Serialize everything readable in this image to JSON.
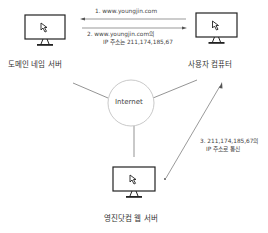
{
  "nodes": {
    "dns_server": {
      "label": "도메인 네임 서버",
      "icon": "monitor-cursor-icon"
    },
    "user_computer": {
      "label": "사용자 컴퓨터",
      "icon": "monitor-cursor-icon"
    },
    "web_server": {
      "label": "영진닷컴 웹 서버",
      "icon": "monitor-cursor-icon"
    },
    "internet": {
      "label": "Internet"
    }
  },
  "messages": {
    "step1": "1.  www.youngjin.com",
    "step2_line1": "2.  www.youngjin.com의",
    "step2_line2": "IP 주소는 211,174,185,67",
    "step3_line1": "3.  211,174,185,67의",
    "step3_line2": "IP 주소로 통신"
  },
  "colors": {
    "line": "#555555",
    "circle": "#bbbbbb",
    "text": "#333333"
  }
}
